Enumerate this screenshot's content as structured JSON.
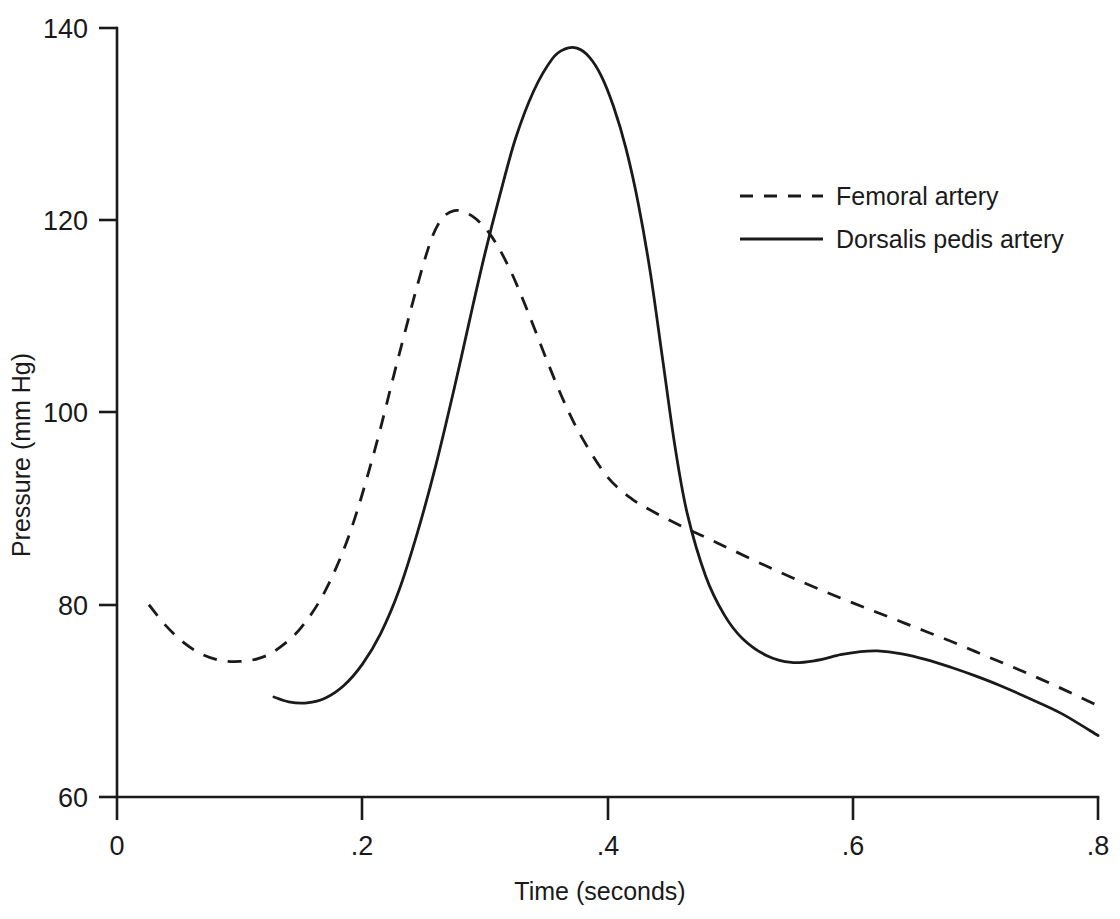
{
  "chart_data": {
    "type": "line",
    "title": "",
    "xlabel": "Time (seconds)",
    "ylabel": "Pressure (mm Hg)",
    "xlim": [
      0,
      0.8
    ],
    "ylim": [
      60,
      140
    ],
    "xticks": [
      "0",
      ".2",
      ".4",
      ".6",
      ".8"
    ],
    "xtick_values": [
      0,
      0.2,
      0.4,
      0.6,
      0.8
    ],
    "yticks": [
      "60",
      "80",
      "100",
      "120",
      "140"
    ],
    "ytick_values": [
      60,
      80,
      100,
      120,
      140
    ],
    "grid": false,
    "legend_position": "upper right",
    "series": [
      {
        "name": "Femoral artery",
        "style": "dashed",
        "color": "#1a1a1a",
        "x": [
          0.026,
          0.04,
          0.055,
          0.07,
          0.085,
          0.1,
          0.115,
          0.13,
          0.15,
          0.17,
          0.19,
          0.21,
          0.23,
          0.25,
          0.262,
          0.275,
          0.29,
          0.305,
          0.32,
          0.335,
          0.35,
          0.365,
          0.38,
          0.4,
          0.42,
          0.44,
          0.46,
          0.48,
          0.5,
          0.53,
          0.56,
          0.59,
          0.62,
          0.65,
          0.68,
          0.71,
          0.74,
          0.77,
          0.8
        ],
        "y": [
          80.0,
          77.8,
          76.0,
          74.8,
          74.2,
          74.1,
          74.4,
          75.3,
          77.6,
          81.5,
          87.5,
          96.0,
          106.0,
          115.5,
          119.6,
          121.0,
          120.4,
          118.4,
          115.0,
          110.5,
          105.6,
          101.0,
          97.2,
          93.3,
          91.0,
          89.5,
          88.2,
          87.0,
          85.8,
          84.0,
          82.3,
          80.7,
          79.2,
          77.7,
          76.2,
          74.6,
          73.0,
          71.3,
          69.5
        ]
      },
      {
        "name": "Dorsalis pedis artery",
        "style": "solid",
        "color": "#1a1a1a",
        "x": [
          0.128,
          0.14,
          0.155,
          0.17,
          0.185,
          0.2,
          0.215,
          0.23,
          0.245,
          0.26,
          0.275,
          0.29,
          0.3,
          0.312,
          0.325,
          0.34,
          0.355,
          0.365,
          0.375,
          0.385,
          0.395,
          0.405,
          0.415,
          0.425,
          0.435,
          0.445,
          0.455,
          0.465,
          0.48,
          0.495,
          0.51,
          0.53,
          0.55,
          0.57,
          0.59,
          0.605,
          0.62,
          0.64,
          0.66,
          0.68,
          0.7,
          0.72,
          0.745,
          0.77,
          0.8
        ],
        "y": [
          70.4,
          69.9,
          69.8,
          70.3,
          71.6,
          73.8,
          77.0,
          81.5,
          87.5,
          94.5,
          102.5,
          111.0,
          116.5,
          122.5,
          128.5,
          133.5,
          136.8,
          137.8,
          137.9,
          137.0,
          135.0,
          131.8,
          127.5,
          121.8,
          114.5,
          105.5,
          96.5,
          89.5,
          83.0,
          79.0,
          76.5,
          74.7,
          74.0,
          74.2,
          74.8,
          75.1,
          75.2,
          74.9,
          74.3,
          73.5,
          72.6,
          71.6,
          70.2,
          68.7,
          66.4
        ]
      }
    ],
    "legend": [
      {
        "label": "Femoral artery",
        "style": "dashed"
      },
      {
        "label": "Dorsalis pedis artery",
        "style": "solid"
      }
    ]
  }
}
